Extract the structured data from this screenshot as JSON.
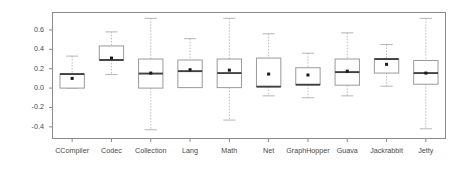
{
  "chart_data": {
    "type": "box",
    "title": "",
    "xlabel": "",
    "ylabel": "Savings in Compilation",
    "ylim": [
      -0.52,
      0.78
    ],
    "grid": false,
    "legend": "none",
    "yticks": [
      0.6,
      0.4,
      0.2,
      0.0,
      -0.2,
      -0.4
    ],
    "ytick_labels": [
      "0.6",
      "0.4",
      "0.2",
      "0.0",
      "-0.2",
      "-0.4"
    ],
    "categories": [
      "CCompiler",
      "Codec",
      "Collection",
      "Lang",
      "Math",
      "Net",
      "GraphHopper",
      "Guava",
      "Jackrabbit",
      "Jetty"
    ],
    "boxes": [
      {
        "category": "CCompiler",
        "whisker_low": 0.0,
        "q1": 0.0,
        "median": 0.145,
        "q3": 0.145,
        "whisker_high": 0.33,
        "mean": 0.1
      },
      {
        "category": "Codec",
        "whisker_low": 0.14,
        "q1": 0.29,
        "median": 0.29,
        "q3": 0.435,
        "whisker_high": 0.58,
        "mean": 0.31
      },
      {
        "category": "Collection",
        "whisker_low": -0.43,
        "q1": 0.0,
        "median": 0.15,
        "q3": 0.3,
        "whisker_high": 0.72,
        "mean": 0.155
      },
      {
        "category": "Lang",
        "whisker_low": 0.01,
        "q1": 0.005,
        "median": 0.175,
        "q3": 0.29,
        "whisker_high": 0.51,
        "mean": 0.19
      },
      {
        "category": "Math",
        "whisker_low": -0.33,
        "q1": 0.005,
        "median": 0.155,
        "q3": 0.3,
        "whisker_high": 0.72,
        "mean": 0.185
      },
      {
        "category": "Net",
        "whisker_low": -0.08,
        "q1": 0.015,
        "median": 0.015,
        "q3": 0.31,
        "whisker_high": 0.56,
        "mean": 0.145
      },
      {
        "category": "GraphHopper",
        "whisker_low": -0.1,
        "q1": 0.035,
        "median": 0.035,
        "q3": 0.21,
        "whisker_high": 0.36,
        "mean": 0.135
      },
      {
        "category": "Guava",
        "whisker_low": -0.08,
        "q1": 0.03,
        "median": 0.165,
        "q3": 0.3,
        "whisker_high": 0.57,
        "mean": 0.175
      },
      {
        "category": "Jackrabbit",
        "whisker_low": 0.02,
        "q1": 0.155,
        "median": 0.3,
        "q3": 0.3,
        "whisker_high": 0.45,
        "mean": 0.245
      },
      {
        "category": "Jetty",
        "whisker_low": -0.42,
        "q1": 0.04,
        "median": 0.155,
        "q3": 0.285,
        "whisker_high": 0.72,
        "mean": 0.155
      }
    ]
  },
  "axis": {
    "y_title": "Savings in Compilation"
  },
  "colors": {
    "frame": "#8a8a8a",
    "box_border": "#9a9a9a",
    "median": "#404040",
    "whisker": "#b5b5b5",
    "mean": "#1a1a1a",
    "text": "#4a4a4a",
    "background": "#ffffff"
  }
}
